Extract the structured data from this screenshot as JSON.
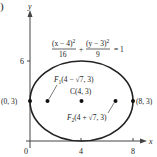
{
  "part_label": ")",
  "axes": {
    "x_label": "x",
    "y_label": "y",
    "origin_label": "0",
    "x_ticks": [
      "4",
      "8"
    ],
    "y_ticks": [
      "6"
    ]
  },
  "equation": {
    "term1_num": "(x − 4)",
    "term1_exp": "2",
    "term1_den": "16",
    "plus": "+",
    "term2_num": "(y − 3)",
    "term2_exp": "2",
    "term2_den": "9",
    "rhs": "= 1"
  },
  "points": {
    "left_vertex": "(0, 3)",
    "right_vertex": "(8, 3)",
    "center": "C(4, 3)",
    "focus1": "F",
    "focus1_sub": "1",
    "focus1_coords": "(4 − √7, 3)",
    "focus2": "F",
    "focus2_sub": "2",
    "focus2_coords": "(4 + √7, 3)"
  },
  "colors": {
    "stroke": "#222222",
    "axis": "#444444"
  }
}
